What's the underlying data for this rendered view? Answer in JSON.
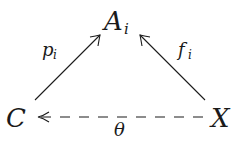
{
  "diagram": {
    "type": "commutative-diagram",
    "nodes": [
      {
        "id": "A",
        "label": "A",
        "subscript": "i"
      },
      {
        "id": "C",
        "label": "C",
        "subscript": ""
      },
      {
        "id": "X",
        "label": "X",
        "subscript": ""
      }
    ],
    "edges": [
      {
        "id": "p",
        "from": "C",
        "to": "A",
        "label": "p",
        "subscript": "i",
        "style": "solid"
      },
      {
        "id": "f",
        "from": "X",
        "to": "A",
        "label": "f",
        "subscript": "i",
        "style": "solid"
      },
      {
        "id": "theta",
        "from": "X",
        "to": "C",
        "label": "θ",
        "subscript": "",
        "style": "dashed"
      }
    ]
  }
}
